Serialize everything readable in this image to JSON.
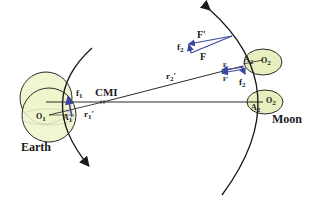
{
  "diagram": {
    "type": "earth-moon orbital force diagram",
    "colors": {
      "body_fill": "#eef3c9",
      "body_stroke": "#2c2c2c",
      "line": "#2a2a2a",
      "force_vector": "#3a46a0",
      "text": "#1a1a1a"
    },
    "labels": {
      "earth": "Earth",
      "moon": "Moon",
      "cmi": "CMI",
      "earth_center": "O",
      "earth_center_sub": "1",
      "earth_point": "A",
      "earth_point_sub": "1",
      "earth_force": "f",
      "earth_force_sub": "1",
      "earth_radius": "r",
      "earth_radius_sub": "1",
      "earth_radius_prime": "′",
      "moon_center_top": "O",
      "moon_center_top_sub": "2",
      "moon_point_top": "A",
      "moon_point_top_sub": "2",
      "moon_center_bottom": "O",
      "moon_center_bottom_sub": "2",
      "moon_point_bottom": "A",
      "moon_point_bottom_sub": "2",
      "moon_radius": "r",
      "moon_radius_sub": "2",
      "moon_radius_prime": "′",
      "vector_F": "F",
      "vector_F_prime": "F′",
      "vector_f2": "f",
      "vector_f2_sub": "2",
      "inset_F_prime": "F′",
      "inset_F": "F",
      "inset_f2": "f",
      "inset_f2_sub": "2"
    }
  }
}
